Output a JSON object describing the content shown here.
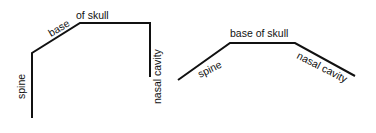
{
  "diagrams": [
    {
      "id": "left",
      "description": "angled configuration (flexed skull base)",
      "labels": {
        "spine": "spine",
        "base": "base",
        "of_skull": "of skull",
        "nasal_cavity": "nasal cavity"
      }
    },
    {
      "id": "right",
      "description": "flattened configuration (obtuse skull base)",
      "labels": {
        "spine": "spine",
        "base_of_skull": "base of skull",
        "nasal_cavity": "nasal cavity"
      }
    }
  ],
  "colors": {
    "line": "#111111",
    "text": "#111111",
    "background": "#ffffff"
  }
}
